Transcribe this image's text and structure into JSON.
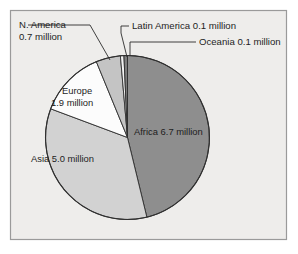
{
  "figure": {
    "background_color": "#ffffff",
    "panel_color": "#eeedeb",
    "frame_color": "#9a9a9a",
    "text_color": "#1d1d1d"
  },
  "chart_data": {
    "type": "pie",
    "title": "",
    "subtitle": "",
    "xlabel": "",
    "ylabel": "",
    "unit": "million",
    "total": 14.5,
    "legend_position": "none",
    "grid": false,
    "start_angle_deg": 0,
    "direction": "clockwise",
    "categories": [
      "Africa",
      "Asia",
      "Europe",
      "N. America",
      "Latin America",
      "Oceania"
    ],
    "values": [
      6.7,
      5.0,
      1.9,
      0.7,
      0.1,
      0.1
    ],
    "labels": [
      "Africa 6.7 million",
      "Asia 5.0 million",
      "Europe 1.9 million",
      "N. America 0.7 million",
      "Latin America 0.1 million",
      "Oceania 0.1 million"
    ],
    "slices": [
      {
        "name": "Africa",
        "value": 6.7,
        "value_text": "6.7",
        "label": "Africa 6.7 million",
        "color": "#8e8e8e",
        "label_placement": "inside",
        "label_lines": [
          "Africa 6.7 million"
        ]
      },
      {
        "name": "Asia",
        "value": 5.0,
        "value_text": "5.0",
        "label": "Asia 5.0 million",
        "color": "#d2d2d2",
        "label_placement": "inside",
        "label_lines": [
          "Asia 5.0 million"
        ]
      },
      {
        "name": "Europe",
        "value": 1.9,
        "value_text": "1.9",
        "label": "Europe 1.9 million",
        "color": "#fcfcfc",
        "label_placement": "inside",
        "label_lines": [
          "Europe",
          "1.9 million"
        ]
      },
      {
        "name": "N. America",
        "value": 0.7,
        "value_text": "0.7",
        "label": "N. America 0.7 million",
        "color": "#c4c4c4",
        "label_placement": "outside-left",
        "label_lines": [
          "N. America",
          "0.7 million"
        ]
      },
      {
        "name": "Latin America",
        "value": 0.1,
        "value_text": "0.1",
        "label": "Latin America 0.1 million",
        "color": "#f2f2f2",
        "label_placement": "outside-right",
        "label_lines": [
          "Latin America 0.1 million"
        ]
      },
      {
        "name": "Oceania",
        "value": 0.1,
        "value_text": "0.1",
        "label": "Oceania 0.1 million",
        "color": "#7d7d7d",
        "label_placement": "outside-right",
        "label_lines": [
          "Oceania 0.1 million"
        ]
      }
    ],
    "annotations": [
      {
        "name": "n-america-leader",
        "for": "N. America"
      },
      {
        "name": "latin-america-leader",
        "for": "Latin America"
      },
      {
        "name": "oceania-leader",
        "for": "Oceania"
      }
    ]
  }
}
